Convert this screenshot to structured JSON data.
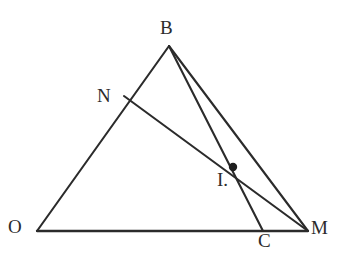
{
  "figure": {
    "kind": "euclidean-geometry-diagram",
    "canvas": {
      "width": 347,
      "height": 259
    },
    "background_color": "#ffffff",
    "stroke_color": "#2b2b2b",
    "stroke_width": 2.1,
    "point_color": "#1e1e1e",
    "label_color": "#2b2b2b",
    "points": {
      "B": {
        "label": "B",
        "x": 169,
        "y": 46
      },
      "N": {
        "label": "N",
        "x": 124,
        "y": 96
      },
      "I": {
        "label": "I.",
        "x": 233,
        "y": 167
      },
      "O": {
        "label": "O",
        "x": 37,
        "y": 231
      },
      "C": {
        "label": "C",
        "x": 263,
        "y": 231
      },
      "M": {
        "label": "M",
        "x": 308,
        "y": 231
      }
    },
    "segments": [
      {
        "name": "segment-OB",
        "from": "O",
        "to": "B"
      },
      {
        "name": "segment-BM",
        "from": "B",
        "to": "M"
      },
      {
        "name": "segment-OM",
        "from": "O",
        "to": "M"
      },
      {
        "name": "segment-BC",
        "from": "B",
        "to": "C"
      },
      {
        "name": "segment-NM",
        "from": "N",
        "to": "M"
      }
    ],
    "marked_points": [
      {
        "name": "point-I",
        "at": "I",
        "radius": 4.2
      }
    ]
  }
}
